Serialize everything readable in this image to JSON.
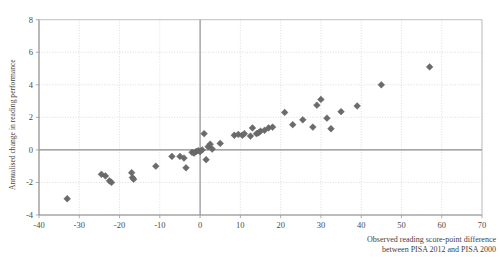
{
  "chart_data": {
    "type": "scatter",
    "title": "",
    "subtitle": "",
    "xlabel": "Observed reading score-point difference between PISA 2012 and PISA 2000",
    "xlabel_line1": "Observed reading score-point difference",
    "xlabel_line2": "between PISA 2012 and PISA 2000",
    "ylabel": "Annualised change in reading performance",
    "xlim": [
      -40,
      70
    ],
    "ylim": [
      -4,
      8
    ],
    "xticks": [
      -40,
      -30,
      -20,
      -10,
      0,
      10,
      20,
      30,
      40,
      50,
      60,
      70
    ],
    "xtick_labels": [
      "-40",
      "-30",
      "-20",
      "-10",
      "0",
      "10",
      "20",
      "30",
      "40",
      "50",
      "60",
      "70"
    ],
    "yticks": [
      -4,
      -2,
      0,
      2,
      4,
      6,
      8
    ],
    "ytick_labels": [
      "-4",
      "-2",
      "0",
      "2",
      "4",
      "6",
      "8"
    ],
    "grid": true,
    "grid_style": "dotted",
    "legend": "none",
    "marker": "diamond",
    "marker_color": "#6b6b6b",
    "zero_lines": [
      {
        "axis": "y",
        "value": 0
      },
      {
        "axis": "x",
        "value": 0
      }
    ],
    "series": [
      {
        "name": "Countries/economies",
        "points": [
          {
            "x": -33.0,
            "y": -3.0
          },
          {
            "x": -24.5,
            "y": -1.5
          },
          {
            "x": -23.5,
            "y": -1.6
          },
          {
            "x": -22.5,
            "y": -1.9
          },
          {
            "x": -22.0,
            "y": -2.0
          },
          {
            "x": -17.0,
            "y": -1.4
          },
          {
            "x": -16.8,
            "y": -1.7
          },
          {
            "x": -16.5,
            "y": -1.8
          },
          {
            "x": -11.0,
            "y": -1.0
          },
          {
            "x": -7.0,
            "y": -0.4
          },
          {
            "x": -5.0,
            "y": -0.4
          },
          {
            "x": -4.0,
            "y": -0.5
          },
          {
            "x": -3.5,
            "y": -1.1
          },
          {
            "x": -2.0,
            "y": -0.15
          },
          {
            "x": -1.5,
            "y": -0.2
          },
          {
            "x": -1.0,
            "y": -0.1
          },
          {
            "x": -0.5,
            "y": -0.05
          },
          {
            "x": 0.0,
            "y": -0.1
          },
          {
            "x": 0.5,
            "y": 0.0
          },
          {
            "x": 1.0,
            "y": 1.0
          },
          {
            "x": 1.5,
            "y": -0.6
          },
          {
            "x": 2.0,
            "y": 0.2
          },
          {
            "x": 2.5,
            "y": 0.35
          },
          {
            "x": 3.0,
            "y": 0.05
          },
          {
            "x": 5.0,
            "y": 0.4
          },
          {
            "x": 8.5,
            "y": 0.9
          },
          {
            "x": 9.5,
            "y": 0.95
          },
          {
            "x": 10.5,
            "y": 0.9
          },
          {
            "x": 11.0,
            "y": 1.0
          },
          {
            "x": 12.5,
            "y": 0.85
          },
          {
            "x": 13.0,
            "y": 1.35
          },
          {
            "x": 14.0,
            "y": 1.0
          },
          {
            "x": 14.5,
            "y": 1.05
          },
          {
            "x": 15.0,
            "y": 1.15
          },
          {
            "x": 16.0,
            "y": 1.2
          },
          {
            "x": 17.0,
            "y": 1.35
          },
          {
            "x": 18.0,
            "y": 1.4
          },
          {
            "x": 21.0,
            "y": 2.3
          },
          {
            "x": 23.0,
            "y": 1.55
          },
          {
            "x": 25.5,
            "y": 1.85
          },
          {
            "x": 28.0,
            "y": 1.4
          },
          {
            "x": 29.0,
            "y": 2.75
          },
          {
            "x": 30.0,
            "y": 3.1
          },
          {
            "x": 31.5,
            "y": 1.95
          },
          {
            "x": 32.5,
            "y": 1.3
          },
          {
            "x": 35.0,
            "y": 2.35
          },
          {
            "x": 39.0,
            "y": 2.7
          },
          {
            "x": 45.0,
            "y": 4.0
          },
          {
            "x": 57.0,
            "y": 5.1
          }
        ]
      }
    ]
  },
  "figure": {
    "background_color": "#ffffff",
    "axis_color": "#808080",
    "grid_color": "#cfcfcf",
    "text_color": "#3f3f3f"
  }
}
